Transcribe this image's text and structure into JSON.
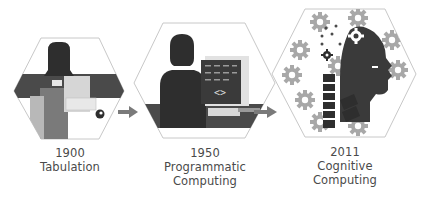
{
  "stages": [
    {
      "year": "1900",
      "title_line1": "Tabulation",
      "title_line2": "",
      "illustration": "person-with-tabulating-machine"
    },
    {
      "year": "1950",
      "title_line1": "Programmatic",
      "title_line2": "Computing",
      "illustration": "person-at-computer-terminal"
    },
    {
      "year": "2011",
      "title_line1": "Cognitive",
      "title_line2": "Computing",
      "illustration": "robot-head-with-gears"
    }
  ],
  "arrows": [
    {
      "from": "1900",
      "to": "1950"
    },
    {
      "from": "1950",
      "to": "2011"
    }
  ],
  "colors": {
    "hex_border": "#c8c8c8",
    "dark": "#3a3a3a",
    "mid": "#6e6e6e",
    "light": "#b4b4b4",
    "gear": "#a8a8a8",
    "arrow": "#7a7a7a",
    "text": "#4a4a4a"
  }
}
